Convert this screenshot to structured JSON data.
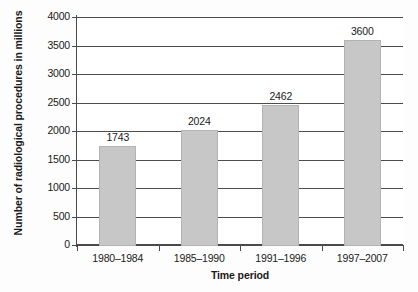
{
  "chart_data": {
    "type": "bar",
    "title": "",
    "xlabel": "Time period",
    "ylabel": "Number of radiological procedures in millions",
    "categories": [
      "1980–1984",
      "1985–1990",
      "1991–1996",
      "1997–2007"
    ],
    "values": [
      1743,
      2024,
      2462,
      3600
    ],
    "value_labels": [
      "1743",
      "2024",
      "2462",
      "3600"
    ],
    "ylim": [
      0,
      4000
    ],
    "ytick_labels": [
      "4000",
      "3500",
      "3000",
      "2500",
      "2000",
      "1500",
      "1000",
      "500",
      "0"
    ],
    "ytick_values": [
      4000,
      3500,
      3000,
      2500,
      2000,
      1500,
      1000,
      500,
      0
    ],
    "grid": "horizontal",
    "legend": "none",
    "bar_color": "#c7c7c7",
    "bar_edge_color": "#b3b3b3",
    "axis_color": "#4a4a4a",
    "text_color": "#1a1a1a"
  }
}
